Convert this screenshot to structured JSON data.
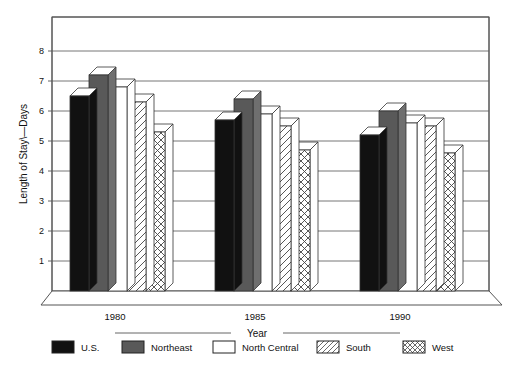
{
  "chart_data": {
    "type": "bar",
    "title": "",
    "subtitle": "",
    "xlabel": "Year",
    "ylabel": "Length of Stay\\—Days",
    "categories": [
      "1980",
      "1985",
      "1990"
    ],
    "series": [
      {
        "name": "U.S.",
        "values": [
          6.5,
          5.7,
          5.2
        ],
        "fill": "#111111",
        "pattern": "solid-black"
      },
      {
        "name": "Northeast",
        "values": [
          7.2,
          6.4,
          6.0
        ],
        "fill": "#595959",
        "pattern": "solid-gray"
      },
      {
        "name": "North Central",
        "values": [
          6.8,
          5.9,
          5.6
        ],
        "fill": "#ffffff",
        "pattern": "solid-white"
      },
      {
        "name": "South",
        "values": [
          6.3,
          5.5,
          5.5
        ],
        "fill": "#ffffff",
        "pattern": "diagonal-hatch"
      },
      {
        "name": "West",
        "values": [
          5.3,
          4.7,
          4.6
        ],
        "fill": "#ffffff",
        "pattern": "cross-hatch"
      }
    ],
    "ylim": [
      0,
      8.6
    ],
    "yticks": [
      1,
      2,
      3,
      4,
      5,
      6,
      7,
      8
    ],
    "ytick_labels": [
      "1",
      "2",
      "3",
      "4",
      "5",
      "6",
      "7",
      "8"
    ],
    "grid": true,
    "grid_axis": "y",
    "legend_position": "bottom",
    "style": "3d-bars",
    "axis_color": "#555555",
    "grid_color": "#666666"
  },
  "legend": {
    "items": [
      {
        "label": "U.S."
      },
      {
        "label": "Northeast"
      },
      {
        "label": "North Central"
      },
      {
        "label": "South"
      },
      {
        "label": "West"
      }
    ]
  }
}
